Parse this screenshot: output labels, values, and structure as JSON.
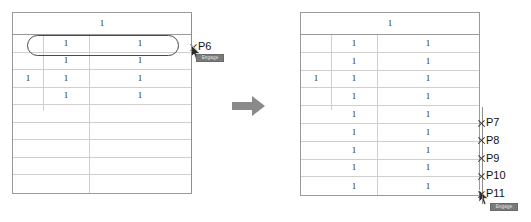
{
  "figure": {
    "kind": "before-after-table-illustration",
    "transition_arrow": {
      "name": "right-arrow",
      "color": "#8a8a8a"
    }
  },
  "colors": {
    "table_border": "#9a9a9a",
    "grid_line": "#cfcfcf",
    "highlight_stroke": "#4a4a4a",
    "marker_stroke": "#3a3a3a",
    "label_text": "#111111",
    "tooltip_bg": "#7a7a7a",
    "tooltip_text": "#e8e8e8",
    "arrow_fill": "#8a8a8a"
  },
  "left_panel": {
    "name": "before-table",
    "header": {
      "value": "1"
    },
    "rows": [
      {
        "group": "",
        "sub": "1",
        "value": "1",
        "highlighted": true
      },
      {
        "group": "",
        "sub": "1",
        "value": "1",
        "highlighted": false
      },
      {
        "group": "1",
        "sub": "1",
        "value": "1",
        "highlighted": false
      },
      {
        "group": "",
        "sub": "1",
        "value": "1",
        "highlighted": false
      },
      {
        "group": "",
        "sub": "",
        "value": "",
        "highlighted": false
      },
      {
        "group": "",
        "sub": "",
        "value": "",
        "highlighted": false
      },
      {
        "group": "",
        "sub": "",
        "value": "",
        "highlighted": false
      },
      {
        "group": "",
        "sub": "",
        "value": "",
        "highlighted": false
      },
      {
        "group": "",
        "sub": "",
        "value": "",
        "highlighted": false
      }
    ],
    "markers": [
      {
        "label": "P6",
        "row_index": 0
      }
    ],
    "tooltip": {
      "text": "Engage"
    }
  },
  "right_panel": {
    "name": "after-table",
    "header": {
      "value": "1"
    },
    "rows": [
      {
        "group": "",
        "sub": "1",
        "value": "1"
      },
      {
        "group": "",
        "sub": "1",
        "value": "1"
      },
      {
        "group": "1",
        "sub": "1",
        "value": "1"
      },
      {
        "group": "",
        "sub": "1",
        "value": "1"
      },
      {
        "group": "",
        "sub": "1",
        "value": "1"
      },
      {
        "group": "",
        "sub": "1",
        "value": "1"
      },
      {
        "group": "",
        "sub": "1",
        "value": "1"
      },
      {
        "group": "",
        "sub": "1",
        "value": "1"
      },
      {
        "group": "",
        "sub": "1",
        "value": "1"
      }
    ],
    "markers": [
      {
        "label": "P7",
        "row_index": 4
      },
      {
        "label": "P8",
        "row_index": 5
      },
      {
        "label": "P9",
        "row_index": 6
      },
      {
        "label": "P10",
        "row_index": 7
      },
      {
        "label": "P11",
        "row_index": 8
      }
    ],
    "tooltip": {
      "text": "Engage"
    }
  }
}
